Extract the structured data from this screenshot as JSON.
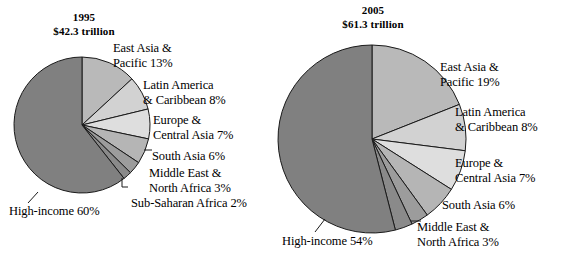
{
  "figure": {
    "background": "#ffffff",
    "text_color": "#000000"
  },
  "chart_data": [
    {
      "type": "pie",
      "title": "1995",
      "subtitle": "$42.3 trillion",
      "year": "1995",
      "total": "$42.3 trillion",
      "unit": "percent",
      "start_angle_deg": 0,
      "direction": "clockwise",
      "categories": [
        "East Asia & Pacific",
        "Latin America & Caribbean",
        "Europe & Central Asia",
        "South Asia",
        "Middle East & North Africa",
        "Sub-Saharan Africa",
        "High-income"
      ],
      "values": [
        13,
        8,
        7,
        6,
        3,
        2,
        60
      ],
      "labels": [
        "East Asia & Pacific 13%",
        "Latin America & Caribbean 8%",
        "Europe & Central Asia 7%",
        "South Asia 6%",
        "Middle East & North Africa 3%",
        "Sub-Saharan Africa 2%",
        "High-income 60%"
      ],
      "colors": [
        "#b9b9b9",
        "#d2d2d2",
        "#dedede",
        "#b5b5b5",
        "#9c9c9c",
        "#8a8a8a",
        "#808080"
      ],
      "slice_edge_color": "#1a1a1a",
      "label_lines": [
        [
          "East Asia &",
          "Pacific 13%"
        ],
        [
          "Latin America",
          "& Caribbean 8%"
        ],
        [
          "Europe &",
          "Central Asia 7%"
        ],
        [
          "South Asia 6%"
        ],
        [
          "Middle East &",
          "North Africa 3%"
        ],
        [
          "Sub-Saharan Africa 2%"
        ],
        [
          "High-income 60%"
        ]
      ]
    },
    {
      "type": "pie",
      "title": "2005",
      "subtitle": "$61.3 trillion",
      "year": "2005",
      "total": "$61.3 trillion",
      "unit": "percent",
      "start_angle_deg": 0,
      "direction": "clockwise",
      "categories": [
        "East Asia & Pacific",
        "Latin America & Caribbean",
        "Europe & Central Asia",
        "South Asia",
        "Middle East & North Africa",
        "Sub-Saharan Africa",
        "High-income"
      ],
      "values": [
        19,
        8,
        7,
        6,
        3,
        3,
        54
      ],
      "labels": [
        "East Asia & Pacific 19%",
        "Latin America & Caribbean 8%",
        "Europe & Central Asia 7%",
        "South Asia 6%",
        "Middle East & North Africa 3%",
        "",
        "High-income 54%"
      ],
      "colors": [
        "#b9b9b9",
        "#d2d2d2",
        "#dedede",
        "#b5b5b5",
        "#9c9c9c",
        "#8a8a8a",
        "#808080"
      ],
      "slice_edge_color": "#1a1a1a",
      "label_lines": [
        [
          "East Asia &",
          "Pacific 19%"
        ],
        [
          "Latin America",
          "& Caribbean 8%"
        ],
        [
          "Europe &",
          "Central Asia 7%"
        ],
        [
          "South Asia 6%"
        ],
        [
          "Middle East &",
          "North Africa 3%"
        ],
        [],
        [
          "High-income 54%"
        ]
      ]
    }
  ],
  "chart_1995": {
    "title_year": "1995",
    "title_total": "$42.3 trillion",
    "label_east_asia_l1": "East Asia &",
    "label_east_asia_l2": "Pacific 13%",
    "label_latin_l1": "Latin America",
    "label_latin_l2": "& Caribbean 8%",
    "label_europe_l1": "Europe &",
    "label_europe_l2": "Central Asia 7%",
    "label_south_asia": "South Asia 6%",
    "label_mena_l1": "Middle East &",
    "label_mena_l2": "North Africa 3%",
    "label_ssa": "Sub-Saharan Africa 2%",
    "label_high_income": "High-income 60%"
  },
  "chart_2005": {
    "title_year": "2005",
    "title_total": "$61.3 trillion",
    "label_east_asia_l1": "East Asia &",
    "label_east_asia_l2": "Pacific 19%",
    "label_latin_l1": "Latin America",
    "label_latin_l2": "& Caribbean 8%",
    "label_europe_l1": "Europe &",
    "label_europe_l2": "Central Asia 7%",
    "label_south_asia": "South Asia 6%",
    "label_mena_l1": "Middle East &",
    "label_mena_l2": "North Africa 3%",
    "label_high_income": "High-income 54%"
  }
}
